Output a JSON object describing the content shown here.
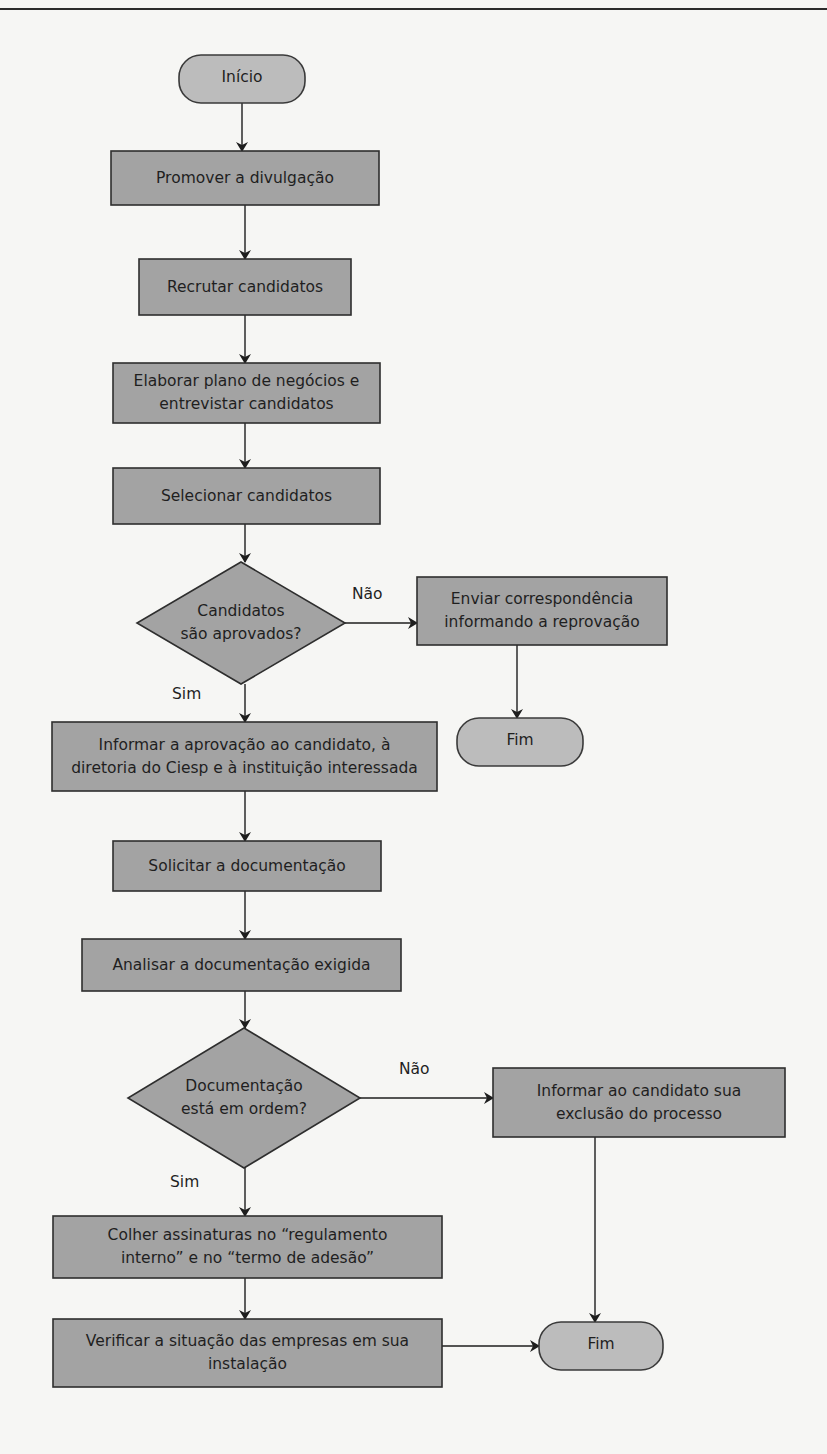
{
  "diagram": {
    "type": "flowchart",
    "colors": {
      "process_fill": "#a3a3a3",
      "terminal_fill": "#bcbcbc",
      "border": "#2e2e2e",
      "background": "#f6f6f4"
    },
    "nodes": [
      {
        "id": "inicio",
        "kind": "terminal",
        "lines": [
          "Início"
        ]
      },
      {
        "id": "divulgacao",
        "kind": "process",
        "lines": [
          "Promover a divulgação"
        ]
      },
      {
        "id": "recrutar",
        "kind": "process",
        "lines": [
          "Recrutar candidatos"
        ]
      },
      {
        "id": "elaborar",
        "kind": "process",
        "lines": [
          "Elaborar plano de negócios e",
          "entrevistar candidatos"
        ]
      },
      {
        "id": "selecionar",
        "kind": "process",
        "lines": [
          "Selecionar candidatos"
        ]
      },
      {
        "id": "aprovados",
        "kind": "decision",
        "lines": [
          "Candidatos",
          "são aprovados?"
        ]
      },
      {
        "id": "enviar",
        "kind": "process",
        "lines": [
          "Enviar correspondência",
          "informando a reprovação"
        ]
      },
      {
        "id": "fim1",
        "kind": "terminal",
        "lines": [
          "Fim"
        ]
      },
      {
        "id": "informar_aprov",
        "kind": "process",
        "lines": [
          "Informar a aprovação ao candidato, à",
          "diretoria do Ciesp e à instituição interessada"
        ]
      },
      {
        "id": "solicitar",
        "kind": "process",
        "lines": [
          "Solicitar a documentação"
        ]
      },
      {
        "id": "analisar",
        "kind": "process",
        "lines": [
          "Analisar a documentação exigida"
        ]
      },
      {
        "id": "docordem",
        "kind": "decision",
        "lines": [
          "Documentação",
          "está em ordem?"
        ]
      },
      {
        "id": "excluir",
        "kind": "process",
        "lines": [
          "Informar ao candidato sua",
          "exclusão do processo"
        ]
      },
      {
        "id": "colher",
        "kind": "process",
        "lines": [
          "Colher assinaturas no “regulamento",
          "interno” e no “termo de adesão”"
        ]
      },
      {
        "id": "verificar",
        "kind": "process",
        "lines": [
          "Verificar a situação das empresas em sua",
          "instalação"
        ]
      },
      {
        "id": "fim2",
        "kind": "terminal",
        "lines": [
          "Fim"
        ]
      }
    ],
    "edges": [
      {
        "from": "inicio",
        "to": "divulgacao",
        "label": ""
      },
      {
        "from": "divulgacao",
        "to": "recrutar",
        "label": ""
      },
      {
        "from": "recrutar",
        "to": "elaborar",
        "label": ""
      },
      {
        "from": "elaborar",
        "to": "selecionar",
        "label": ""
      },
      {
        "from": "selecionar",
        "to": "aprovados",
        "label": ""
      },
      {
        "from": "aprovados",
        "to": "enviar",
        "label": "Não"
      },
      {
        "from": "enviar",
        "to": "fim1",
        "label": ""
      },
      {
        "from": "aprovados",
        "to": "informar_aprov",
        "label": "Sim"
      },
      {
        "from": "informar_aprov",
        "to": "solicitar",
        "label": ""
      },
      {
        "from": "solicitar",
        "to": "analisar",
        "label": ""
      },
      {
        "from": "analisar",
        "to": "docordem",
        "label": ""
      },
      {
        "from": "docordem",
        "to": "excluir",
        "label": "Não"
      },
      {
        "from": "excluir",
        "to": "fim2",
        "label": ""
      },
      {
        "from": "docordem",
        "to": "colher",
        "label": "Sim"
      },
      {
        "from": "colher",
        "to": "verificar",
        "label": ""
      },
      {
        "from": "verificar",
        "to": "fim2",
        "label": ""
      }
    ]
  }
}
